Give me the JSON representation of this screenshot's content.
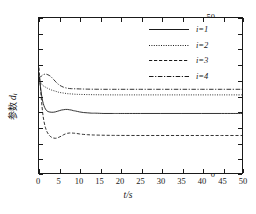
{
  "chart_data": {
    "type": "line",
    "title": "",
    "xlabel": "t/s",
    "ylabel_cn": "参数",
    "ylabel_sym": "d",
    "ylabel_sub": "i",
    "xlim": [
      0,
      50
    ],
    "ylim": [
      0,
      50
    ],
    "xticks": [
      0,
      5,
      10,
      15,
      20,
      25,
      30,
      35,
      40,
      45,
      50
    ],
    "yticks": [
      0,
      5,
      10,
      15,
      20,
      25,
      30,
      35,
      40,
      45,
      50
    ],
    "xtick_labels": [
      "0",
      "5",
      "10",
      "15",
      "20",
      "25",
      "30",
      "35",
      "40",
      "45",
      "50"
    ],
    "ytick_labels": [
      "0",
      "5",
      "10",
      "15",
      "20",
      "25",
      "30",
      "35",
      "40",
      "45",
      "50"
    ],
    "grid": false,
    "legend_position": "top-right",
    "line_color": "#1a1a1a",
    "series": [
      {
        "name": "i=1",
        "style": "solid",
        "dasharray": "",
        "steady_value": 19.2,
        "x": [
          0,
          0.3,
          0.6,
          0.9,
          1.2,
          1.6,
          2,
          2.5,
          3,
          3.5,
          4,
          4.5,
          5,
          5.5,
          6,
          6.5,
          7,
          7.5,
          8,
          8.5,
          9,
          10,
          11,
          12,
          13,
          14,
          16,
          18,
          20,
          25,
          30,
          35,
          40,
          45,
          50
        ],
        "y": [
          31.5,
          28.5,
          25.5,
          23.2,
          21.8,
          20.6,
          20.0,
          19.7,
          19.6,
          19.6,
          19.7,
          19.9,
          20.1,
          20.3,
          20.4,
          20.5,
          20.5,
          20.4,
          20.3,
          20.1,
          20.0,
          19.7,
          19.5,
          19.4,
          19.3,
          19.3,
          19.2,
          19.2,
          19.2,
          19.2,
          19.2,
          19.2,
          19.2,
          19.2,
          19.2
        ]
      },
      {
        "name": "i=2",
        "style": "dotted",
        "dasharray": "1,1.4",
        "steady_value": 25.2,
        "x": [
          0,
          0.3,
          0.6,
          0.9,
          1.2,
          1.6,
          2,
          2.5,
          3,
          3.5,
          4,
          4.5,
          5,
          6,
          7,
          8,
          9,
          10,
          12,
          14,
          16,
          18,
          20,
          25,
          30,
          35,
          40,
          45,
          50
        ],
        "y": [
          31.0,
          29.6,
          28.8,
          28.3,
          28.0,
          27.7,
          27.4,
          27.1,
          26.8,
          26.6,
          26.4,
          26.2,
          26.0,
          25.8,
          25.6,
          25.5,
          25.4,
          25.35,
          25.3,
          25.25,
          25.22,
          25.2,
          25.2,
          25.2,
          25.2,
          25.2,
          25.2,
          25.2,
          25.2
        ]
      },
      {
        "name": "i=3",
        "style": "dashed",
        "dasharray": "3.2,1.8",
        "steady_value": 12.1,
        "x": [
          0,
          0.3,
          0.6,
          0.9,
          1.2,
          1.6,
          2,
          2.5,
          3,
          3.5,
          4,
          4.5,
          5,
          5.5,
          6,
          6.5,
          7,
          7.5,
          8,
          8.5,
          9,
          10,
          11,
          12,
          13,
          14,
          16,
          18,
          20,
          25,
          30,
          35,
          40,
          45,
          50
        ],
        "y": [
          34.0,
          28.5,
          23.5,
          19.5,
          16.8,
          14.6,
          13.2,
          12.2,
          11.6,
          11.3,
          11.2,
          11.3,
          11.6,
          11.9,
          12.3,
          12.6,
          12.8,
          12.9,
          12.9,
          12.85,
          12.8,
          12.6,
          12.45,
          12.35,
          12.28,
          12.24,
          12.18,
          12.14,
          12.12,
          12.1,
          12.1,
          12.1,
          12.1,
          12.1,
          12.1
        ]
      },
      {
        "name": "i=4",
        "style": "dashdot",
        "dasharray": "4.5,1.6,1.2,1.6",
        "steady_value": 27.0,
        "x": [
          0,
          0.3,
          0.6,
          0.9,
          1.2,
          1.6,
          2,
          2.5,
          3,
          3.5,
          4,
          4.5,
          5,
          5.5,
          6,
          6.5,
          7,
          7.5,
          8,
          8.5,
          9,
          10,
          11,
          12,
          13,
          14,
          16,
          18,
          20,
          25,
          30,
          35,
          40,
          45,
          50
        ],
        "y": [
          30.6,
          30.9,
          31.3,
          31.6,
          31.8,
          31.9,
          31.8,
          31.5,
          31.0,
          30.3,
          29.6,
          28.9,
          28.4,
          28.0,
          27.7,
          27.5,
          27.35,
          27.25,
          27.2,
          27.18,
          27.16,
          27.12,
          27.08,
          27.05,
          27.03,
          27.02,
          27.0,
          27.0,
          27.0,
          27.0,
          27.0,
          27.0,
          27.0,
          27.0,
          27.0
        ]
      }
    ]
  },
  "legend": {
    "items": [
      {
        "label": "i=1"
      },
      {
        "label": "i=2"
      },
      {
        "label": "i=3"
      },
      {
        "label": "i=4"
      }
    ]
  }
}
